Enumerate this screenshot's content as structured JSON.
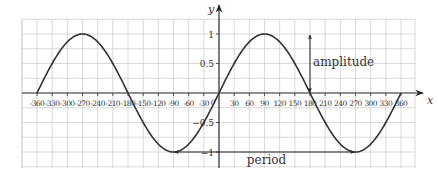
{
  "chart_data": {
    "type": "line",
    "title": "",
    "xlabel": "x",
    "ylabel": "y",
    "xlim": [
      -360,
      360
    ],
    "ylim": [
      -1,
      1
    ],
    "grid": true,
    "x_ticks": [
      -360,
      -330,
      -300,
      -270,
      -240,
      -210,
      -180,
      -150,
      -120,
      -90,
      -60,
      -30,
      30,
      60,
      90,
      120,
      150,
      180,
      210,
      240,
      270,
      300,
      330,
      360
    ],
    "x_tick_labels": [
      "-360",
      "-330",
      "-300",
      "-270",
      "-240",
      "-210",
      "-180",
      "-150",
      "-120",
      "-90",
      "-60",
      "-30",
      "30",
      "60",
      "90",
      "120",
      "150",
      "180",
      "210",
      "240",
      "270",
      "300",
      "330",
      "360"
    ],
    "origin_label": "0",
    "y_ticks": [
      1,
      0.5,
      -0.5,
      -1
    ],
    "y_tick_labels": [
      "1",
      "0.5",
      "-0.5",
      "-1"
    ],
    "series": [
      {
        "name": "y = sin x",
        "function": "sin",
        "x": [
          -360,
          -330,
          -300,
          -270,
          -240,
          -210,
          -180,
          -150,
          -120,
          -90,
          -60,
          -30,
          0,
          30,
          60,
          90,
          120,
          150,
          180,
          210,
          240,
          270,
          300,
          330,
          360
        ],
        "y": [
          0,
          0.5,
          0.87,
          1,
          0.87,
          0.5,
          0,
          -0.5,
          -0.87,
          -1,
          -0.87,
          -0.5,
          0,
          0.5,
          0.87,
          1,
          0.87,
          0.5,
          0,
          -0.5,
          -0.87,
          -1,
          -0.87,
          -0.5,
          0
        ]
      }
    ],
    "annotations": [
      {
        "label": "amplitude",
        "type": "double-arrow-vertical",
        "x": 180,
        "y_from": 0,
        "y_to": 1
      },
      {
        "label": "period",
        "type": "double-arrow-horizontal",
        "y": -1,
        "x_from": -90,
        "x_to": 270
      }
    ]
  }
}
